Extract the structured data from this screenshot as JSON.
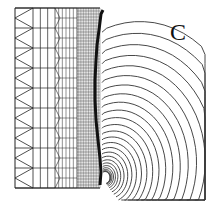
{
  "figure": {
    "panel_label": "C",
    "colors": {
      "mesh": "#222222",
      "curve": "#111111",
      "contours": "#333333",
      "background": "#ffffff"
    },
    "mesh_zones": [
      {
        "name": "coarse-triangular",
        "rows": 9
      },
      {
        "name": "coarse-rectangular",
        "rows": 9,
        "cols": 3
      },
      {
        "name": "medium",
        "rows": 18,
        "cols": 6
      },
      {
        "name": "fine",
        "rows": 60,
        "cols": 14
      }
    ],
    "contour_count": 26
  }
}
